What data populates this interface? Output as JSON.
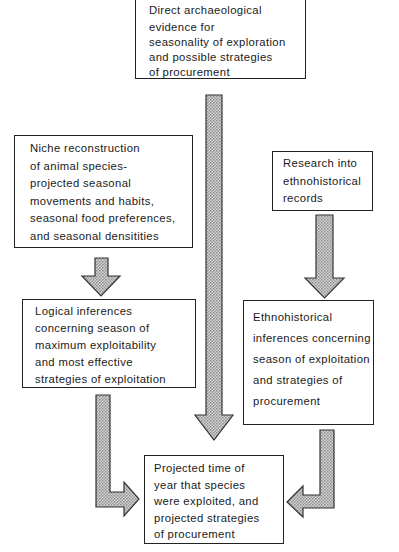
{
  "diagram": {
    "boxes": {
      "direct_evidence": {
        "lines": [
          "Direct archaeological",
          "evidence for",
          "seasonality of exploration",
          "and possible  strategies",
          "of procurement"
        ]
      },
      "niche_reconstruction": {
        "lines": [
          "Niche reconstruction",
          "of animal species-",
          "projected seasonal",
          "movements and habits,",
          "seasonal food preferences,",
          "and seasonal densitities"
        ]
      },
      "ethnohistorical_research": {
        "lines": [
          "Research into",
          "ethnohistorical",
          "records"
        ]
      },
      "logical_inferences": {
        "lines": [
          "Logical inferences",
          "concerning season of",
          "maximum exploitability",
          "and most effective",
          "strategies of exploitation"
        ]
      },
      "ethnohistorical_inferences": {
        "lines": [
          "Ethnohistorical",
          "inferences concerning",
          "season of exploitation",
          "and strategies of",
          "procurement"
        ]
      },
      "projected_outcome": {
        "lines": [
          "Projected time of",
          "year that species",
          "were exploited, and",
          "projected strategies",
          "of procurement"
        ]
      }
    },
    "arrows": [
      {
        "from": "direct_evidence",
        "to": "projected_outcome",
        "style": "straight-down"
      },
      {
        "from": "niche_reconstruction",
        "to": "logical_inferences",
        "style": "straight-down"
      },
      {
        "from": "ethnohistorical_research",
        "to": "ethnohistorical_inferences",
        "style": "straight-down"
      },
      {
        "from": "logical_inferences",
        "to": "projected_outcome",
        "style": "elbow-down-right"
      },
      {
        "from": "ethnohistorical_inferences",
        "to": "projected_outcome",
        "style": "elbow-down-left"
      }
    ],
    "colors": {
      "border": "#222222",
      "arrow_fill": "#bdbdbd",
      "arrow_stroke": "#333333"
    }
  }
}
